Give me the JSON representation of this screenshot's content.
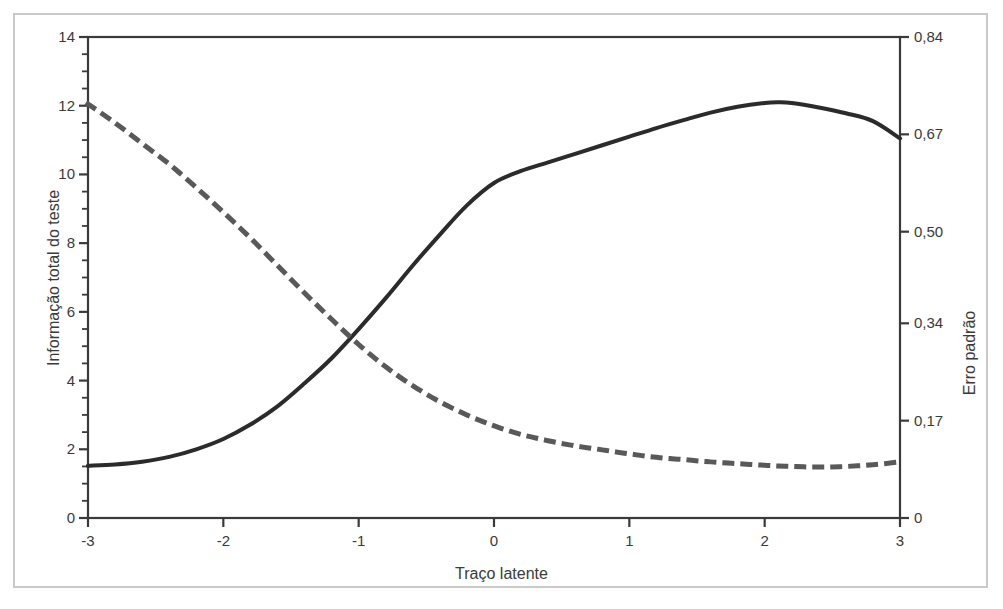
{
  "chart_data": {
    "type": "line",
    "title": "",
    "xlabel": "Traço latente",
    "ylabel": "Informação total do teste",
    "ylabel_right": "Erro padrão",
    "xlim": [
      -3,
      3
    ],
    "ylim": [
      0,
      14
    ],
    "ylim_right": [
      0,
      0.84
    ],
    "grid": false,
    "legend": "none",
    "x_ticks": [
      "-3",
      "-2",
      "-1",
      "0",
      "1",
      "2",
      "3"
    ],
    "x_tick_values": [
      -3,
      -2,
      -1,
      0,
      1,
      2,
      3
    ],
    "y_ticks_left": [
      "0",
      "2",
      "4",
      "6",
      "8",
      "10",
      "12",
      "14"
    ],
    "y_tick_values_left": [
      0,
      2,
      4,
      6,
      8,
      10,
      12,
      14
    ],
    "y_ticks_right": [
      "0",
      "0,17",
      "0,34",
      "0,50",
      "0,67",
      "0,84"
    ],
    "y_tick_values_right": [
      0,
      0.17,
      0.34,
      0.5,
      0.67,
      0.84
    ],
    "minor_ticks_per_interval_left": 4,
    "series": [
      {
        "name": "Informação total do teste",
        "axis": "left",
        "style": "solid",
        "color": "#2b2b2b",
        "width": 4,
        "x": [
          -3.0,
          -2.8,
          -2.6,
          -2.4,
          -2.2,
          -2.0,
          -1.8,
          -1.6,
          -1.4,
          -1.2,
          -1.0,
          -0.8,
          -0.6,
          -0.4,
          -0.2,
          0.0,
          0.2,
          0.4,
          0.6,
          0.8,
          1.0,
          1.2,
          1.4,
          1.6,
          1.8,
          2.0,
          2.1,
          2.2,
          2.4,
          2.6,
          2.8,
          3.0
        ],
        "values": [
          1.52,
          1.56,
          1.64,
          1.78,
          2.0,
          2.3,
          2.72,
          3.25,
          3.92,
          4.65,
          5.5,
          6.4,
          7.35,
          8.25,
          9.1,
          9.75,
          10.1,
          10.35,
          10.6,
          10.85,
          11.1,
          11.35,
          11.58,
          11.8,
          11.97,
          12.08,
          12.1,
          12.08,
          11.95,
          11.78,
          11.55,
          11.05
        ]
      },
      {
        "name": "Erro padrão",
        "axis": "right",
        "style": "dashed",
        "color": "#595959",
        "width": 5,
        "x": [
          -3.0,
          -2.8,
          -2.6,
          -2.4,
          -2.2,
          -2.0,
          -1.8,
          -1.6,
          -1.4,
          -1.2,
          -1.0,
          -0.8,
          -0.6,
          -0.4,
          -0.2,
          0.0,
          0.2,
          0.4,
          0.6,
          0.8,
          1.0,
          1.2,
          1.4,
          1.6,
          1.8,
          2.0,
          2.2,
          2.4,
          2.6,
          2.8,
          3.0
        ],
        "values_left_scale": [
          12.05,
          11.5,
          10.9,
          10.3,
          9.62,
          8.9,
          8.15,
          7.35,
          6.55,
          5.78,
          5.05,
          4.4,
          3.85,
          3.38,
          3.0,
          2.68,
          2.44,
          2.25,
          2.1,
          1.98,
          1.86,
          1.77,
          1.7,
          1.64,
          1.58,
          1.54,
          1.5,
          1.49,
          1.5,
          1.55,
          1.64
        ],
        "values": [
          0.723,
          0.69,
          0.654,
          0.618,
          0.577,
          0.534,
          0.489,
          0.441,
          0.393,
          0.347,
          0.303,
          0.264,
          0.231,
          0.203,
          0.18,
          0.161,
          0.146,
          0.135,
          0.126,
          0.119,
          0.112,
          0.106,
          0.102,
          0.098,
          0.095,
          0.092,
          0.09,
          0.089,
          0.09,
          0.093,
          0.098
        ]
      }
    ],
    "annotations": {
      "crossing_point_x": -1.27,
      "crossing_point_y_left": 4.8,
      "peak_information_x": 2.1,
      "peak_information_y": 12.1,
      "min_standard_error_x": 2.4,
      "min_standard_error_y": 0.089
    }
  }
}
